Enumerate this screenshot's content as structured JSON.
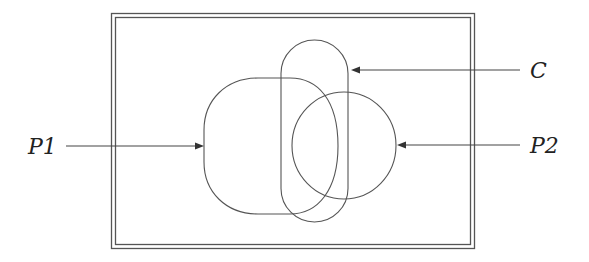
{
  "diagram": {
    "type": "set-region-diagram",
    "frame": {
      "style": "double-border rectangle"
    },
    "shapes": [
      {
        "id": "P1",
        "kind": "rounded region (D-shape)"
      },
      {
        "id": "C",
        "kind": "vertical capsule"
      },
      {
        "id": "P2",
        "kind": "circle"
      }
    ],
    "labels": {
      "p1": "P1",
      "c": "C",
      "p2": "P2"
    },
    "arrows": [
      {
        "from_label": "P1",
        "direction": "right",
        "points_to": "P1"
      },
      {
        "from_label": "C",
        "direction": "left",
        "points_to": "C"
      },
      {
        "from_label": "P2",
        "direction": "left",
        "points_to": "P2"
      }
    ],
    "colors": {
      "stroke": "#555555",
      "text": "#222222",
      "background": "#ffffff"
    }
  }
}
